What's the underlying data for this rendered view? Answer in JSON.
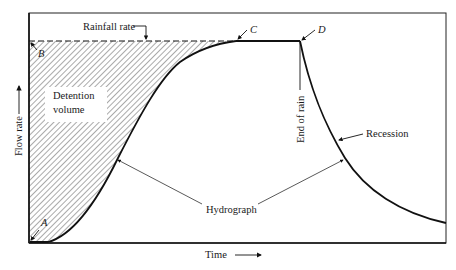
{
  "diagram": {
    "axes": {
      "x_label": "Time",
      "y_label": "Flow rate"
    },
    "labels": {
      "rainfall_rate": "Rainfall rate",
      "detention_volume_line1": "Detention",
      "detention_volume_line2": "volume",
      "end_of_rain": "End of rain",
      "recession": "Recession",
      "hydrograph": "Hydrograph"
    },
    "points": {
      "A": "A",
      "B": "B",
      "C": "C",
      "D": "D"
    },
    "colors": {
      "line": "#111111",
      "hatch": "#555555",
      "background": "#ffffff"
    }
  }
}
